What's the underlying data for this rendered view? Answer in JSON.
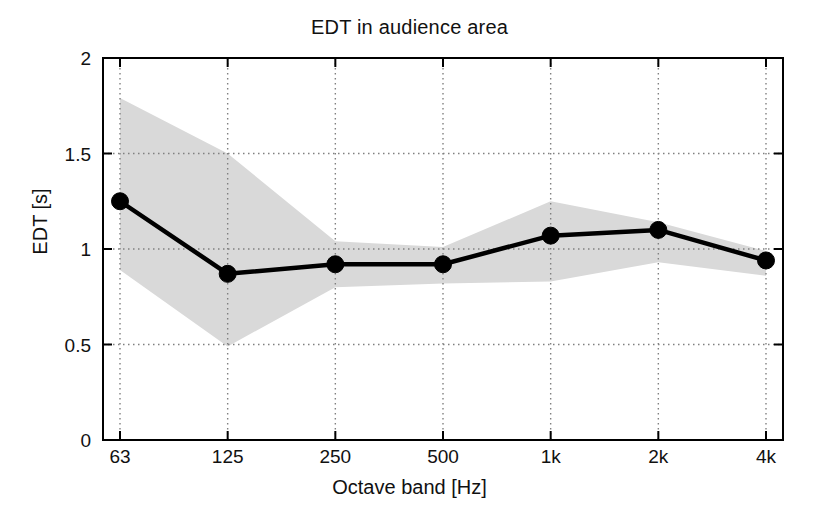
{
  "chart_data": {
    "type": "line",
    "title": "EDT in audience area",
    "xlabel": "Octave band [Hz]",
    "ylabel": "EDT [s]",
    "categories": [
      "63",
      "125",
      "250",
      "500",
      "1k",
      "2k",
      "4k"
    ],
    "values": [
      1.25,
      0.87,
      0.92,
      0.92,
      1.07,
      1.1,
      0.94
    ],
    "band_upper": [
      1.79,
      1.5,
      1.04,
      1.01,
      1.25,
      1.14,
      0.99
    ],
    "band_lower": [
      0.89,
      0.49,
      0.8,
      0.82,
      0.83,
      0.93,
      0.86
    ],
    "band_label": "spread (shaded)",
    "ylim": [
      0,
      2
    ],
    "yticks": [
      "0",
      "0.5",
      "1",
      "1.5",
      "2"
    ],
    "ytick_values": [
      0,
      0.5,
      1,
      1.5,
      2
    ],
    "xtick_labels": [
      "63",
      "125",
      "250",
      "500",
      "1k",
      "2k",
      "4k"
    ],
    "grid": true,
    "legend": "none",
    "series_name": "EDT mean",
    "colors": {
      "line": "#000000",
      "marker": "#000000",
      "band": "#d9d9d9",
      "grid": "#808080",
      "axis": "#000000",
      "background": "#ffffff"
    }
  }
}
